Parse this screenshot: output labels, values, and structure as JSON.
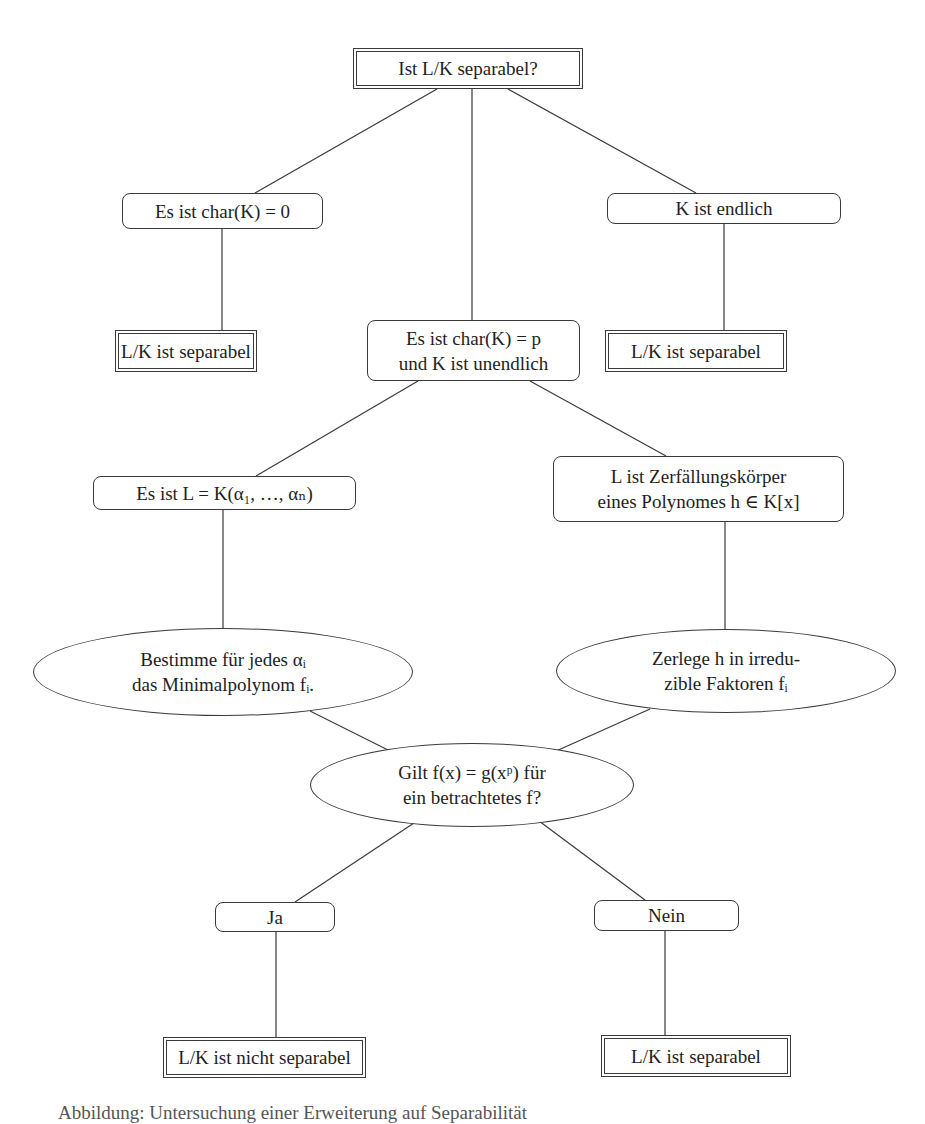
{
  "diagram": {
    "type": "flowchart",
    "language": "de",
    "colors": {
      "line": "#3a3a3a",
      "text": "#1e1e1e",
      "background": "#ffffff"
    },
    "nodes": {
      "root": {
        "shape": "double-box",
        "lines": [
          "Ist L/K separabel?"
        ]
      },
      "char0": {
        "shape": "rounded-box",
        "lines": [
          "Es ist char(K) = 0"
        ]
      },
      "finite": {
        "shape": "rounded-box",
        "lines": [
          "K ist endlich"
        ]
      },
      "sep_left": {
        "shape": "double-box",
        "lines": [
          "L/K ist separabel"
        ]
      },
      "charp": {
        "shape": "rounded-box",
        "lines": [
          "Es ist char(K) = p",
          "und K ist unendlich"
        ]
      },
      "sep_right": {
        "shape": "double-box",
        "lines": [
          "L/K ist separabel"
        ]
      },
      "generated": {
        "shape": "rounded-box",
        "lines": [
          "Es ist L = K(α₁, …, αₙ)"
        ]
      },
      "splitting": {
        "shape": "rounded-box",
        "lines": [
          "L ist Zerfällungskörper",
          "eines Polynomes h ∈ K[x]"
        ]
      },
      "minpoly": {
        "shape": "ellipse",
        "lines": [
          "Bestimme für jedes αᵢ",
          "das Minimalpolynom fᵢ."
        ]
      },
      "factor": {
        "shape": "ellipse",
        "lines": [
          "Zerlege h in irredu-",
          "zible Faktoren fᵢ"
        ]
      },
      "question": {
        "shape": "ellipse",
        "lines": [
          "Gilt f(x) = g(xᵖ) für",
          "ein betrachtetes f?"
        ]
      },
      "yes": {
        "shape": "rounded-box",
        "lines": [
          "Ja"
        ]
      },
      "no": {
        "shape": "rounded-box",
        "lines": [
          "Nein"
        ]
      },
      "not_sep": {
        "shape": "double-box",
        "lines": [
          "L/K ist nicht separabel"
        ]
      },
      "sep_bottom": {
        "shape": "double-box",
        "lines": [
          "L/K ist separabel"
        ]
      }
    },
    "edges": [
      [
        "root",
        "char0"
      ],
      [
        "root",
        "charp"
      ],
      [
        "root",
        "finite"
      ],
      [
        "char0",
        "sep_left"
      ],
      [
        "finite",
        "sep_right"
      ],
      [
        "charp",
        "generated"
      ],
      [
        "charp",
        "splitting"
      ],
      [
        "generated",
        "minpoly"
      ],
      [
        "splitting",
        "factor"
      ],
      [
        "minpoly",
        "question"
      ],
      [
        "factor",
        "question"
      ],
      [
        "question",
        "yes"
      ],
      [
        "question",
        "no"
      ],
      [
        "yes",
        "not_sep"
      ],
      [
        "no",
        "sep_bottom"
      ]
    ],
    "caption_partial": "Abbildung: Untersuchung einer Erweiterung auf Separabilität"
  }
}
